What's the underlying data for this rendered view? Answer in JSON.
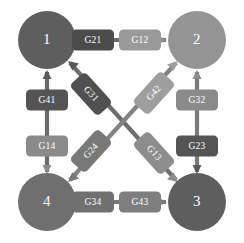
{
  "diagram": {
    "type": "directed-graph",
    "background_color": "#ffffff",
    "nodes": [
      {
        "id": "1",
        "label": "1",
        "cx": 47,
        "cy": 40,
        "r": 29,
        "color": "#5e5e5e"
      },
      {
        "id": "2",
        "label": "2",
        "cx": 197,
        "cy": 40,
        "r": 29,
        "color": "#949494"
      },
      {
        "id": "3",
        "label": "3",
        "cx": 197,
        "cy": 202,
        "r": 29,
        "color": "#5e5e5e"
      },
      {
        "id": "4",
        "label": "4",
        "cx": 47,
        "cy": 202,
        "r": 29,
        "color": "#6f6f6f"
      }
    ],
    "edges": [
      {
        "id": "G21",
        "label": "G21",
        "from": "2",
        "to": "1",
        "side": "top",
        "color": "#4b4b4b",
        "lx": 93,
        "ly": 40,
        "angle": 0,
        "w": 42,
        "h": 21
      },
      {
        "id": "G12",
        "label": "G12",
        "from": "1",
        "to": "2",
        "side": "top",
        "color": "#9a9a9a",
        "lx": 140,
        "ly": 40,
        "angle": 0,
        "w": 42,
        "h": 21
      },
      {
        "id": "G34",
        "label": "G34",
        "from": "3",
        "to": "4",
        "side": "bottom",
        "color": "#707070",
        "lx": 93,
        "ly": 202,
        "angle": 0,
        "w": 42,
        "h": 21
      },
      {
        "id": "G43",
        "label": "G43",
        "from": "4",
        "to": "3",
        "side": "bottom",
        "color": "#7e7e7e",
        "lx": 140,
        "ly": 202,
        "angle": 0,
        "w": 42,
        "h": 21
      },
      {
        "id": "G41",
        "label": "G41",
        "from": "4",
        "to": "1",
        "side": "left",
        "color": "#545454",
        "lx": 47,
        "ly": 100,
        "angle": 0,
        "w": 42,
        "h": 21
      },
      {
        "id": "G14",
        "label": "G14",
        "from": "1",
        "to": "4",
        "side": "left",
        "color": "#8a8a8a",
        "lx": 47,
        "ly": 146,
        "angle": 0,
        "w": 42,
        "h": 21
      },
      {
        "id": "G32",
        "label": "G32",
        "from": "3",
        "to": "2",
        "side": "right",
        "color": "#8a8a8a",
        "lx": 197,
        "ly": 100,
        "angle": 0,
        "w": 42,
        "h": 21
      },
      {
        "id": "G23",
        "label": "G23",
        "from": "2",
        "to": "3",
        "side": "right",
        "color": "#545454",
        "lx": 197,
        "ly": 146,
        "angle": 0,
        "w": 42,
        "h": 21
      },
      {
        "id": "G31",
        "label": "G31",
        "from": "3",
        "to": "1",
        "side": "diag-nw",
        "color": "#505050",
        "lx": 91,
        "ly": 94,
        "angle": 46,
        "w": 42,
        "h": 21
      },
      {
        "id": "G13",
        "label": "G13",
        "from": "1",
        "to": "3",
        "side": "diag-se",
        "color": "#8d8d8d",
        "lx": 152,
        "ly": 150,
        "angle": 46,
        "w": 42,
        "h": 21
      },
      {
        "id": "G42",
        "label": "G42",
        "from": "4",
        "to": "2",
        "side": "diag-ne",
        "color": "#9e9e9e",
        "lx": 152,
        "ly": 94,
        "angle": -46,
        "w": 42,
        "h": 21
      },
      {
        "id": "G24",
        "label": "G24",
        "from": "2",
        "to": "4",
        "side": "diag-sw",
        "color": "#787878",
        "lx": 91,
        "ly": 150,
        "angle": -46,
        "w": 42,
        "h": 21
      }
    ],
    "arrow_color_primary": "#5e5e5e",
    "arrow_color_secondary": "#909090"
  }
}
